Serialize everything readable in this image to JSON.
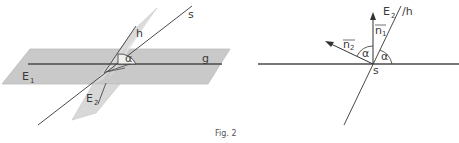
{
  "figure": {
    "caption": "Fig. 2",
    "left_diagram": {
      "plane1_label": "E",
      "plane1_sub": "1",
      "plane2_label": "E",
      "plane2_sub": "2",
      "line_s": "s",
      "line_h": "h",
      "line_g": "g",
      "angle": "α"
    },
    "right_diagram": {
      "plane2_label": "E",
      "plane2_sub": "2",
      "line_h": "/h",
      "normal1": "n",
      "normal1_sub": "1",
      "normal2": "n",
      "normal2_sub": "2",
      "angle1": "α",
      "angle2": "α",
      "point_s": "s"
    }
  },
  "colors": {
    "plane_fill": "#c8c8c8",
    "plane2_fill": "#dcdcdc",
    "line": "#555555",
    "dark_line": "#444444"
  }
}
